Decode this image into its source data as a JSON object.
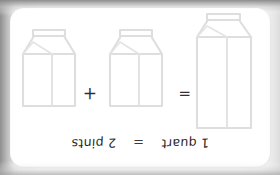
{
  "card": {
    "title": "1 quart = 2 pints",
    "orientation": "upside-down",
    "background_color": "#ffffff",
    "frame_color": "#8e8e8e",
    "stroke_color": "#dedede",
    "text_color": "#262626"
  },
  "caption": {
    "left_label": "1 quart",
    "equals_symbol": "=",
    "right_label": "2 pints"
  },
  "diagram": {
    "equals_symbol": "=",
    "plus_symbol": "+",
    "items": [
      {
        "name": "quart-carton",
        "label": "1 quart",
        "unit": "quart",
        "count": 1,
        "size": "tall",
        "body_width": 54,
        "body_height": 91
      },
      {
        "name": "pint-carton-1",
        "label": "1 pint",
        "unit": "pint",
        "count": 1,
        "size": "short",
        "body_width": 52,
        "body_height": 52
      },
      {
        "name": "pint-carton-2",
        "label": "1 pint",
        "unit": "pint",
        "count": 1,
        "size": "short",
        "body_width": 52,
        "body_height": 52
      }
    ]
  },
  "equation": {
    "expression": "1 quart = 1 pint + 1 pint",
    "left_value": 1,
    "left_unit": "quart",
    "right_value": 2,
    "right_unit": "pints"
  }
}
